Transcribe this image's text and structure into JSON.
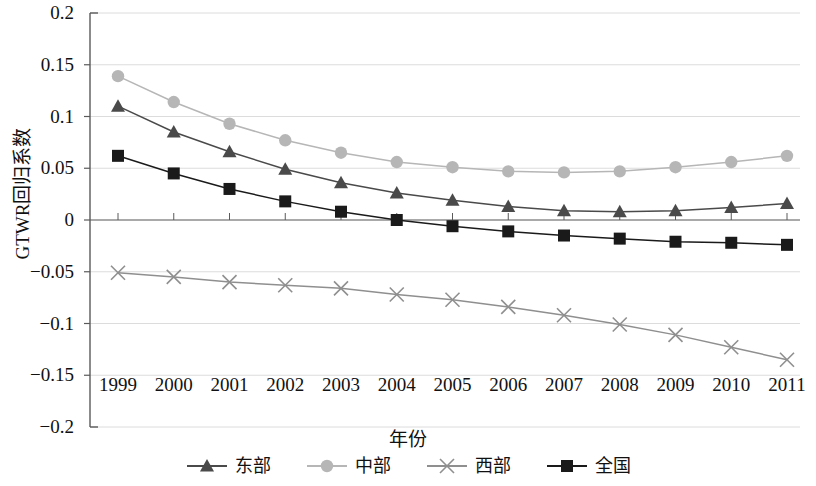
{
  "chart_data": {
    "type": "line",
    "title": "",
    "xlabel": "年份",
    "ylabel": "GTWR回归系数",
    "categories": [
      "1999",
      "2000",
      "2001",
      "2002",
      "2003",
      "2004",
      "2005",
      "2006",
      "2007",
      "2008",
      "2009",
      "2010",
      "2011"
    ],
    "x": [
      1999,
      2000,
      2001,
      2002,
      2003,
      2004,
      2005,
      2006,
      2007,
      2008,
      2009,
      2010,
      2011
    ],
    "ylim": [
      -0.2,
      0.2
    ],
    "yticks": [
      0.2,
      0.15,
      0.1,
      0.05,
      0,
      -0.05,
      -0.1,
      -0.15,
      -0.2
    ],
    "ytick_labels": [
      "0.2",
      "0.15",
      "0.1",
      "0.05",
      "0",
      "−0.05",
      "−0.1",
      "−0.15",
      "−0.2"
    ],
    "grid": true,
    "grid_axis": "y",
    "legend_position": "bottom",
    "series": [
      {
        "name": "东部",
        "marker": "triangle",
        "color": "#4a4a4a",
        "values": [
          0.11,
          0.085,
          0.066,
          0.049,
          0.036,
          0.026,
          0.019,
          0.013,
          0.009,
          0.008,
          0.009,
          0.012,
          0.016
        ]
      },
      {
        "name": "中部",
        "marker": "circle",
        "color": "#b6b6b6",
        "values": [
          0.139,
          0.114,
          0.093,
          0.077,
          0.065,
          0.056,
          0.051,
          0.047,
          0.046,
          0.047,
          0.051,
          0.056,
          0.062
        ]
      },
      {
        "name": "西部",
        "marker": "cross",
        "color": "#8f8f8f",
        "values": [
          -0.051,
          -0.055,
          -0.06,
          -0.063,
          -0.066,
          -0.072,
          -0.077,
          -0.084,
          -0.092,
          -0.101,
          -0.111,
          -0.123,
          -0.135
        ]
      },
      {
        "name": "全国",
        "marker": "square",
        "color": "#1a1a1a",
        "values": [
          0.062,
          0.045,
          0.03,
          0.018,
          0.008,
          0.0,
          -0.006,
          -0.011,
          -0.015,
          -0.018,
          -0.021,
          -0.022,
          -0.024
        ]
      }
    ]
  },
  "axes": {
    "x_title": "年份",
    "y_title": "GTWR回归系数"
  },
  "legend": {
    "items": [
      {
        "label": "东部"
      },
      {
        "label": "中部"
      },
      {
        "label": "西部"
      },
      {
        "label": "全国"
      }
    ]
  }
}
